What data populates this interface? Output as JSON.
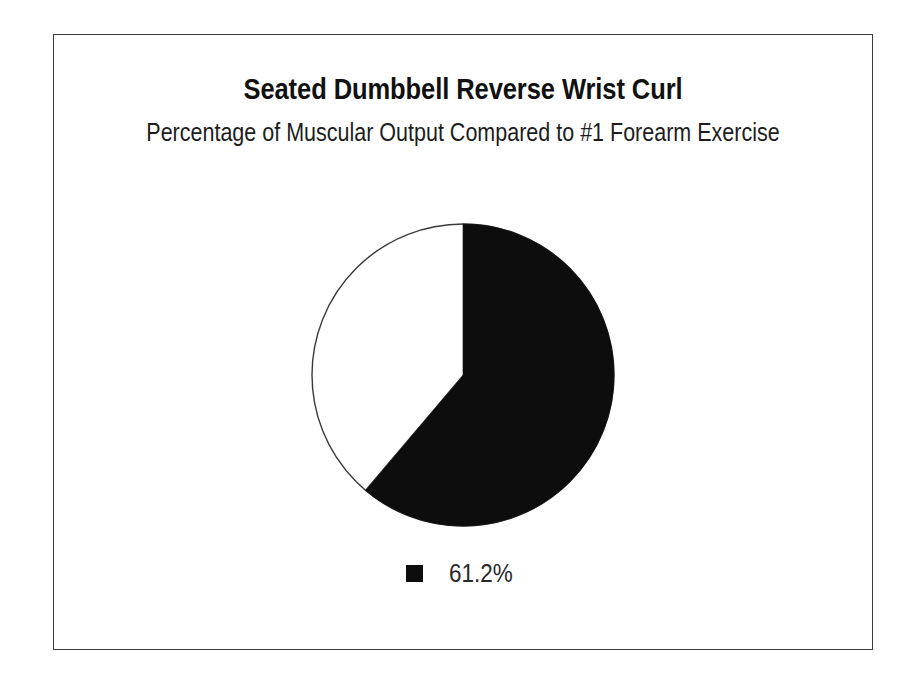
{
  "chart_data": {
    "type": "pie",
    "title": "Seated Dumbbell Reverse Wrist Curl",
    "subtitle": "Percentage of Muscular Output Compared to #1 Forearm Exercise",
    "categories": [
      "61.2%",
      "Remainder"
    ],
    "values": [
      61.2,
      38.8
    ],
    "value_labels": [
      "61.2%",
      ""
    ],
    "colors": [
      "#0d0d0d",
      "#ffffff"
    ],
    "legend": {
      "position": "bottom",
      "entries": [
        {
          "label": "61.2%",
          "color": "#0d0d0d"
        }
      ]
    },
    "start_angle_deg": 0,
    "direction": "clockwise",
    "slice_outline_color": "#3a3a3a",
    "grid": false,
    "xlabel": "",
    "ylabel": ""
  },
  "frame": {
    "border_color": "#3a3a3a",
    "background": "#ffffff"
  }
}
